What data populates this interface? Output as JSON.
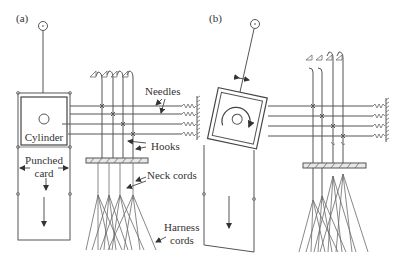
{
  "figure": {
    "panel_a": {
      "label": "(a)",
      "cylinder_label": "Cylinder",
      "card_label_line1": "Punched",
      "card_label_line2": "card",
      "annotations": {
        "needles": "Needles",
        "hooks": "Hooks",
        "neck_cords_line1": "Neck cords",
        "harness_line1": "Harness",
        "harness_line2": "cords"
      }
    },
    "panel_b": {
      "label": "(b)"
    }
  }
}
